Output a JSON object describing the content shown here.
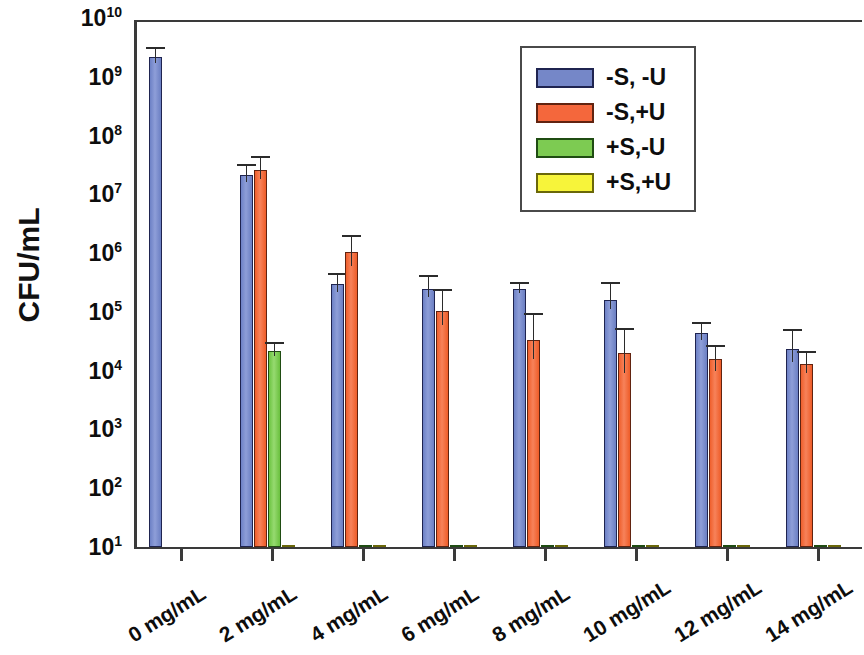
{
  "chart_data": {
    "type": "bar",
    "title": "",
    "subtitle": "",
    "xlabel": "",
    "ylabel": "CFU/mL",
    "yscale": "log",
    "ylim": [
      10,
      10000000000
    ],
    "grid": false,
    "legend_position": "upper-right",
    "categories": [
      "0 mg/mL",
      "2 mg/mL",
      "4 mg/mL",
      "6 mg/mL",
      "8 mg/mL",
      "10 mg/mL",
      "12 mg/mL",
      "14 mg/mL"
    ],
    "ytick_labels": [
      "10",
      "10",
      "10",
      "10",
      "10",
      "10",
      "10",
      "10",
      "10",
      "10"
    ],
    "ytick_exponents": [
      "10",
      "9",
      "8",
      "7",
      "6",
      "5",
      "4",
      "3",
      "2",
      "1"
    ],
    "series": [
      {
        "name": "-S, -U",
        "color": "#7587c8",
        "values": [
          2200000000,
          21000000,
          300000,
          250000,
          250000,
          160000,
          43000,
          23000
        ],
        "err_high": [
          3000000000,
          30000000,
          430000,
          400000,
          300000,
          300000,
          63000,
          48000
        ],
        "err_low": [
          1700000000,
          16000000,
          220000,
          180000,
          210000,
          110000,
          33000,
          14000
        ]
      },
      {
        "name": "-S,+U",
        "color": "#f4673c",
        "values": [
          null,
          26000000,
          1050000,
          105000,
          33000,
          20000,
          15500,
          13000
        ],
        "err_high": [
          null,
          42000000,
          1900000,
          230000,
          90000,
          50000,
          25000,
          20000
        ],
        "err_low": [
          null,
          18000000,
          600000,
          60000,
          16000,
          9000,
          10000,
          9000
        ]
      },
      {
        "name": "+S,-U",
        "color": "#7dcb52",
        "values": [
          null,
          22000,
          11,
          11,
          11,
          11,
          11,
          11
        ],
        "err_high": [
          null,
          28000,
          null,
          null,
          null,
          null,
          null,
          null
        ],
        "err_low": [
          null,
          18000,
          null,
          null,
          null,
          null,
          null,
          null
        ]
      },
      {
        "name": "+S,+U",
        "color": "#f7f43a",
        "values": [
          null,
          11,
          11,
          11,
          11,
          11,
          11,
          11
        ],
        "err_high": [
          null,
          null,
          null,
          null,
          null,
          null,
          null,
          null
        ],
        "err_low": [
          null,
          null,
          null,
          null,
          null,
          null,
          null,
          null
        ]
      }
    ]
  },
  "axis": {
    "ylabel": "CFU/mL"
  },
  "legend": {
    "items": [
      {
        "label": "-S, -U",
        "color": "#7587c8",
        "swatch": "blue"
      },
      {
        "label": "-S,+U",
        "color": "#f4673c",
        "swatch": "orange"
      },
      {
        "label": "+S,-U",
        "color": "#7dcb52",
        "swatch": "green"
      },
      {
        "label": "+S,+U",
        "color": "#f7f43a",
        "swatch": "yellow"
      }
    ]
  }
}
